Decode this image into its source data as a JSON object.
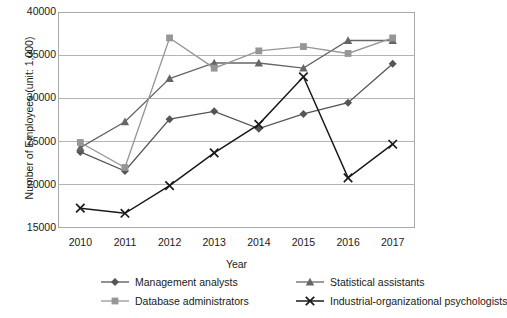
{
  "chart_data": {
    "type": "line",
    "title": "",
    "xlabel": "Year",
    "ylabel": "Number of Employees (unit: 1,000)",
    "categories": [
      "2010",
      "2011",
      "2012",
      "2013",
      "2014",
      "2015",
      "2016",
      "2017"
    ],
    "x": [
      2010,
      2011,
      2012,
      2013,
      2014,
      2015,
      2016,
      2017
    ],
    "ylim": [
      15000,
      40000
    ],
    "y_ticks": [
      "15000",
      "20000",
      "25000",
      "30000",
      "35000",
      "40000"
    ],
    "y_tick_values": [
      15000,
      20000,
      25000,
      30000,
      35000,
      40000
    ],
    "grid": "horizontal",
    "legend_position": "bottom",
    "series": [
      {
        "name": "Management analysts",
        "marker": "diamond",
        "color": "#555555",
        "values": [
          23800,
          21600,
          27600,
          28500,
          26500,
          28200,
          29500,
          34000
        ]
      },
      {
        "name": "Statistical assistants",
        "marker": "triangle",
        "color": "#666666",
        "values": [
          24300,
          27300,
          32300,
          34100,
          34100,
          33500,
          36700,
          36700
        ]
      },
      {
        "name": "Database administrators",
        "marker": "square",
        "color": "#969696",
        "values": [
          24900,
          22000,
          37000,
          33500,
          35500,
          36000,
          35200,
          37000
        ]
      },
      {
        "name": "Industrial-organizational psychologists",
        "marker": "cross",
        "color": "#1a1a1a",
        "values": [
          17300,
          16700,
          19900,
          23700,
          27000,
          32500,
          20800,
          24700
        ]
      }
    ]
  },
  "colors": {
    "grid": "#b4b4b4",
    "frame": "#a8a8a8",
    "text": "#1a1a1a",
    "background": "#ffffff"
  },
  "legend": {
    "items": [
      {
        "label": "Management analysts",
        "marker": "diamond",
        "color": "#555555"
      },
      {
        "label": "Statistical assistants",
        "marker": "triangle",
        "color": "#666666"
      },
      {
        "label": "Database administrators",
        "marker": "square",
        "color": "#969696"
      },
      {
        "label": "Industrial-organizational psychologists",
        "marker": "cross",
        "color": "#1a1a1a"
      }
    ]
  }
}
